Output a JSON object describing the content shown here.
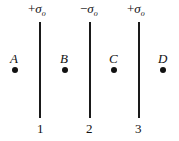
{
  "diagram": {
    "sheets": [
      {
        "id": "1",
        "sign": "+",
        "symbol": "σ",
        "subscript": "o",
        "number": "1"
      },
      {
        "id": "2",
        "sign": "−",
        "symbol": "σ",
        "subscript": "o",
        "number": "2"
      },
      {
        "id": "3",
        "sign": "+",
        "symbol": "σ",
        "subscript": "o",
        "number": "3"
      }
    ],
    "points": [
      {
        "label": "A"
      },
      {
        "label": "B"
      },
      {
        "label": "C"
      },
      {
        "label": "D"
      }
    ]
  }
}
